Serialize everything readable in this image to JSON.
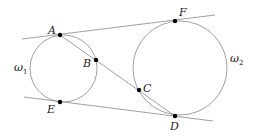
{
  "diagram": {
    "circles": [
      {
        "name": "omega1",
        "label": "ω",
        "sub": "1",
        "cx": 63.5,
        "cy": 68.5,
        "r": 33.5
      },
      {
        "name": "omega2",
        "label": "ω",
        "sub": "2",
        "cx": 180,
        "cy": 68,
        "r": 47
      }
    ],
    "points": [
      {
        "label": "A",
        "x": 60,
        "y": 35
      },
      {
        "label": "B",
        "x": 96,
        "y": 60
      },
      {
        "label": "C",
        "x": 139,
        "y": 90
      },
      {
        "label": "D",
        "x": 175,
        "y": 116
      },
      {
        "label": "E",
        "x": 60,
        "y": 102
      },
      {
        "label": "F",
        "x": 175,
        "y": 21
      }
    ],
    "lines": [
      {
        "name": "tangent-top",
        "x1": 22,
        "y1": 39,
        "x2": 215,
        "y2": 15
      },
      {
        "name": "tangent-bottom",
        "x1": 24,
        "y1": 97,
        "x2": 213,
        "y2": 121
      },
      {
        "name": "secant-AD",
        "x1": 60,
        "y1": 35,
        "x2": 175,
        "y2": 116
      }
    ],
    "colors": {
      "stroke": "#888888",
      "point": "#000000",
      "text": "#222222"
    }
  }
}
